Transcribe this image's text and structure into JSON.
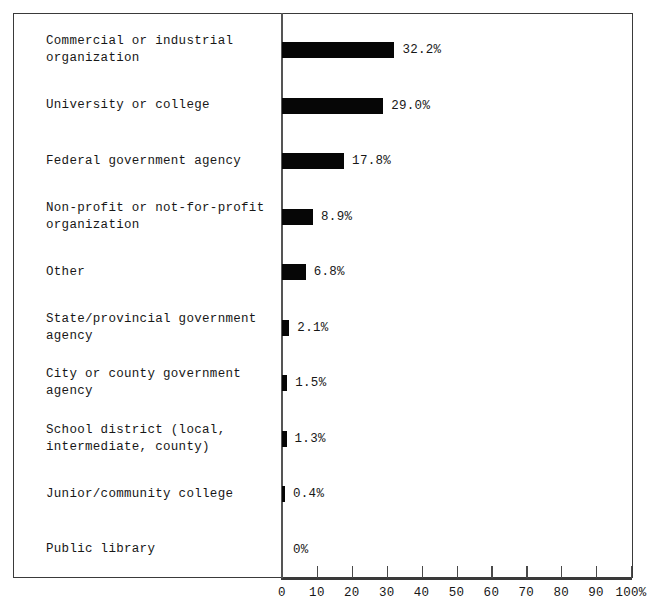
{
  "chart_data": {
    "type": "bar",
    "orientation": "horizontal",
    "title": "",
    "subtitle": "",
    "xlabel": "",
    "ylabel": "",
    "xlim": [
      0,
      100
    ],
    "grid": false,
    "legend": null,
    "categories": [
      "Commercial or industrial\norganization",
      "University or college",
      "Federal government agency",
      "Non-profit or not-for-profit\norganization",
      "Other",
      "State/provincial government\nagency",
      "City or county government\nagency",
      "School district (local,\nintermediate, county)",
      "Junior/community college",
      "Public library"
    ],
    "values": [
      32.2,
      29.0,
      17.8,
      8.9,
      6.8,
      2.1,
      1.5,
      1.3,
      0.4,
      0
    ],
    "value_labels": [
      "32.2%",
      "29.0%",
      "17.8%",
      "8.9%",
      "6.8%",
      "2.1%",
      "1.5%",
      "1.3%",
      "0.4%",
      "0%"
    ],
    "xticks": [
      0,
      10,
      20,
      30,
      40,
      50,
      60,
      70,
      80,
      90,
      100
    ],
    "xtick_labels": [
      "0",
      "10",
      "20",
      "30",
      "40",
      "50",
      "60",
      "70",
      "80",
      "90",
      "100%"
    ],
    "bar_color": "#060606",
    "background_color": "#ffffff",
    "axis_color": "#3a3a3a"
  }
}
